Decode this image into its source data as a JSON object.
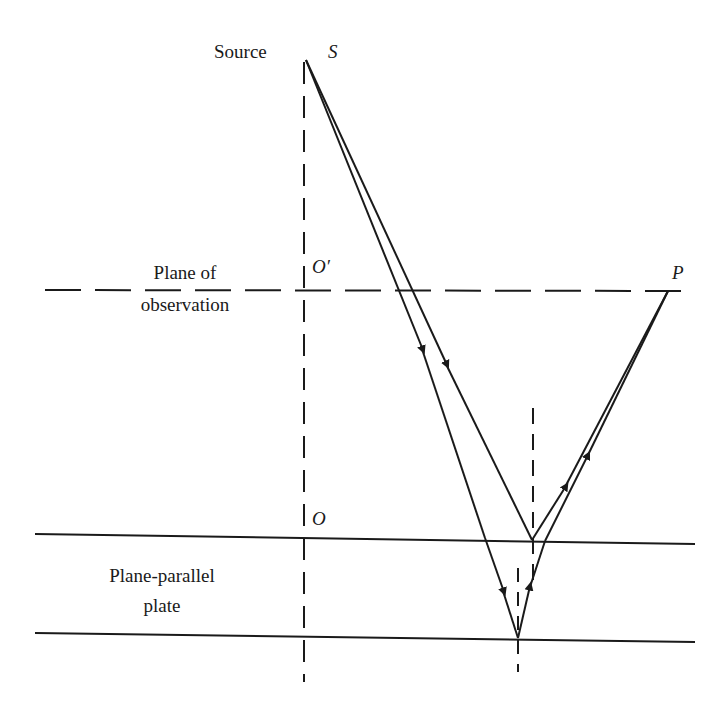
{
  "labels": {
    "source_text": "Source",
    "source_point": "S",
    "plane_obs_line1": "Plane of",
    "plane_obs_line2": "observation",
    "o_prime": "O′",
    "p_point": "P",
    "o_point": "O",
    "plate_line1": "Plane-parallel",
    "plate_line2": "plate"
  },
  "colors": {
    "ink": "#1a1a1a",
    "background": "#ffffff"
  },
  "geometry": {
    "source": [
      306,
      60
    ],
    "observation_plane_y": 290,
    "plate_top_y": 540,
    "plate_bottom_y": 638,
    "point_P": [
      668,
      291
    ],
    "reflection_top": [
      532,
      540
    ],
    "reflection_bottom": [
      518,
      638
    ]
  }
}
